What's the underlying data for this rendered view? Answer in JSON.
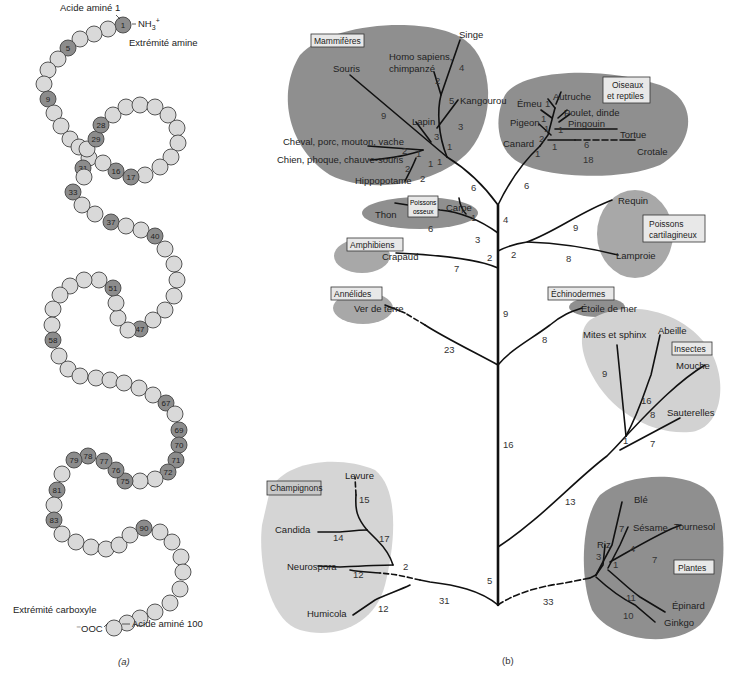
{
  "panel_a": {
    "caption": "(a)",
    "top_label": "Acide aminé 1",
    "nh3": "NH3+",
    "amine_end": "Extrémité amine",
    "carboxyl_end": "Extrémité carboxyle",
    "ooc": "⁻OOC",
    "last_label": "Acide aminé 100",
    "bead_fill": "#d9d9d9",
    "highlight_fill": "#8c8c8c",
    "beads": [
      [
        123,
        25,
        "1"
      ],
      [
        108,
        29,
        ""
      ],
      [
        94,
        34,
        ""
      ],
      [
        80,
        39,
        ""
      ],
      [
        68,
        48,
        "5"
      ],
      [
        58,
        59,
        ""
      ],
      [
        48,
        70,
        ""
      ],
      [
        44,
        84,
        ""
      ],
      [
        48,
        99,
        "9"
      ],
      [
        54,
        113,
        ""
      ],
      [
        61,
        126,
        ""
      ],
      [
        70,
        139,
        ""
      ],
      [
        79,
        147,
        ""
      ],
      [
        89,
        158,
        ""
      ],
      [
        83,
        168,
        "31"
      ],
      [
        84,
        177,
        ""
      ],
      [
        73,
        192,
        "33"
      ],
      [
        82,
        205,
        ""
      ],
      [
        95,
        214,
        ""
      ],
      [
        111,
        222,
        "37"
      ],
      [
        126,
        226,
        ""
      ],
      [
        141,
        230,
        ""
      ],
      [
        155,
        236,
        "40"
      ],
      [
        165,
        249,
        ""
      ],
      [
        174,
        264,
        ""
      ],
      [
        177,
        280,
        ""
      ],
      [
        174,
        296,
        ""
      ],
      [
        165,
        310,
        ""
      ],
      [
        153,
        320,
        ""
      ],
      [
        140,
        329,
        "47"
      ],
      [
        128,
        330,
        ""
      ],
      [
        118,
        318,
        ""
      ],
      [
        116,
        303,
        ""
      ],
      [
        113,
        288,
        "51"
      ],
      [
        99,
        280,
        ""
      ],
      [
        84,
        280,
        ""
      ],
      [
        70,
        286,
        ""
      ],
      [
        60,
        295,
        ""
      ],
      [
        53,
        309,
        ""
      ],
      [
        52,
        325,
        ""
      ],
      [
        53,
        340,
        "58"
      ],
      [
        59,
        356,
        ""
      ],
      [
        68,
        369,
        ""
      ],
      [
        80,
        376,
        ""
      ],
      [
        96,
        378,
        ""
      ],
      [
        110,
        380,
        ""
      ],
      [
        124,
        383,
        ""
      ],
      [
        139,
        388,
        ""
      ],
      [
        153,
        395,
        ""
      ],
      [
        166,
        403,
        "67"
      ],
      [
        175,
        414,
        ""
      ],
      [
        179,
        430,
        "69"
      ],
      [
        179,
        445,
        "70"
      ],
      [
        176,
        460,
        "71"
      ],
      [
        168,
        472,
        "72"
      ],
      [
        155,
        479,
        ""
      ],
      [
        140,
        481,
        ""
      ],
      [
        125,
        481,
        "75"
      ],
      [
        116,
        470,
        "76"
      ],
      [
        104,
        461,
        "77"
      ],
      [
        88,
        456,
        "78"
      ],
      [
        74,
        460,
        "79"
      ],
      [
        62,
        474,
        ""
      ],
      [
        57,
        490,
        "81"
      ],
      [
        54,
        505,
        ""
      ],
      [
        54,
        520,
        "83"
      ],
      [
        62,
        534,
        ""
      ],
      [
        76,
        542,
        ""
      ],
      [
        91,
        547,
        ""
      ],
      [
        106,
        549,
        ""
      ],
      [
        119,
        545,
        ""
      ],
      [
        130,
        535,
        ""
      ],
      [
        144,
        528,
        "90"
      ],
      [
        160,
        532,
        ""
      ],
      [
        172,
        542,
        ""
      ],
      [
        181,
        557,
        ""
      ],
      [
        183,
        572,
        ""
      ],
      [
        180,
        589,
        ""
      ],
      [
        170,
        603,
        ""
      ],
      [
        155,
        612,
        ""
      ],
      [
        140,
        618,
        ""
      ],
      [
        127,
        623,
        ""
      ],
      [
        114,
        628,
        ""
      ]
    ],
    "loop_beads": [
      [
        87,
        149,
        ""
      ],
      [
        96,
        139,
        "29"
      ],
      [
        101,
        125,
        "28"
      ],
      [
        113,
        115,
        ""
      ],
      [
        126,
        107,
        ""
      ],
      [
        140,
        105,
        ""
      ],
      [
        155,
        107,
        ""
      ],
      [
        168,
        115,
        ""
      ],
      [
        177,
        128,
        ""
      ],
      [
        178,
        143,
        ""
      ],
      [
        171,
        157,
        ""
      ],
      [
        160,
        167,
        ""
      ],
      [
        145,
        175,
        ""
      ],
      [
        131,
        177,
        "17"
      ],
      [
        116,
        171,
        "16"
      ],
      [
        103,
        163,
        ""
      ]
    ]
  },
  "panel_b": {
    "caption": "(b)",
    "colors": {
      "dark": "#8f8f8f",
      "mid": "#a8a8a8",
      "light": "#cfcfcf",
      "vlight": "#d8d8d8"
    },
    "groups": {
      "mammiferes": "Mammifères",
      "oiseaux_1": "Oiseaux",
      "oiseaux_2": "et reptiles",
      "poissons_osseux_1": "Poissons",
      "poissons_osseux_2": "osseux",
      "poissons_cart_1": "Poissons",
      "poissons_cart_2": "cartilagineux",
      "amphibiens": "Amphibiens",
      "annelides": "Annélides",
      "echinodermes": "Échinodermes",
      "insectes": "Insectes",
      "champignons": "Champignons",
      "plantes": "Plantes"
    },
    "species": {
      "singe": "Singe",
      "homo1": "Homo sapiens,",
      "homo2": "chimpanzé",
      "souris": "Souris",
      "kangourou": "Kangourou",
      "lapin": "Lapin",
      "cheval": "Cheval, porc, mouton, vache",
      "chien": "Chien, phoque, chauve-souris",
      "hippo": "Hippopotame",
      "autruche": "Autruche",
      "emeu": "Émeu",
      "poulet": "Poulet, dinde",
      "pingouin": "Pingouin",
      "pigeon": "Pigeon",
      "tortue": "Tortue",
      "canard": "Canard",
      "crotale": "Crotale",
      "thon": "Thon",
      "carpe": "Carpe",
      "requin": "Requin",
      "lamproie": "Lamproie",
      "crapaud": "Crapaud",
      "ver": "Ver de terre",
      "etoile": "Étoile de mer",
      "mites": "Mites et sphinx",
      "abeille": "Abeille",
      "mouche": "Mouche",
      "sauterelles": "Sauterelles",
      "levure": "Levure",
      "candida": "Candida",
      "neurospora": "Neurospora",
      "humicola": "Humicola",
      "ble": "Blé",
      "sesame": "Sésame",
      "tournesol": "Tournesol",
      "riz": "Riz",
      "epinard": "Épinard",
      "ginkgo": "Ginkgo"
    },
    "branch_numbers": {
      "m9": "9",
      "m4": "4",
      "m2": "2",
      "m5": "5",
      "m3a": "3",
      "m3b": "3",
      "m1a": "1",
      "m2a": "2",
      "m1b": "1",
      "m2b": "2",
      "m1c": "1",
      "m1d": "1",
      "m2c": "2",
      "m2d": "2",
      "m6": "6",
      "o1a": "1",
      "o1b": "1",
      "o1c": "1",
      "o1d": "1",
      "o2": "2",
      "o1e": "1",
      "o1f": "1",
      "o6": "6",
      "o18": "18",
      "o6b": "6",
      "p1": "1",
      "p6": "6",
      "p3": "3",
      "t4": "4",
      "t2a": "2",
      "a7": "7",
      "r9": "9",
      "r2": "2",
      "r8": "8",
      "t9": "9",
      "an23": "23",
      "e8": "8",
      "t16": "16",
      "i9": "9",
      "i16": "16",
      "i8": "8",
      "i1": "1",
      "i7": "7",
      "i13": "13",
      "c15": "15",
      "c14": "14",
      "c17": "17",
      "c12a": "12",
      "c2": "2",
      "c12b": "12",
      "c31": "31",
      "t5": "5",
      "pl33": "33",
      "pl7a": "7",
      "pl4": "4",
      "pl3": "3",
      "pl1": "1",
      "pl7b": "7",
      "pl11": "11",
      "pl10": "10"
    }
  }
}
